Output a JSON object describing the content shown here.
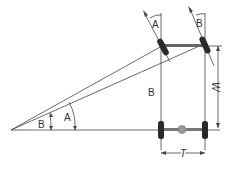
{
  "diagram": {
    "type": "vehicle steering geometry (Ackermann)",
    "labels": {
      "inner_wheel_angle": "A",
      "outer_wheel_angle": "B",
      "apex_angle_outer": "B",
      "apex_angle_inner": "A",
      "wheelbase_side_label": "B",
      "wheelbase": "W",
      "track": "T"
    },
    "colors": {
      "line": "#444444",
      "tire": "#2a2a2a",
      "differential": "#999999",
      "background": "#ffffff"
    }
  }
}
